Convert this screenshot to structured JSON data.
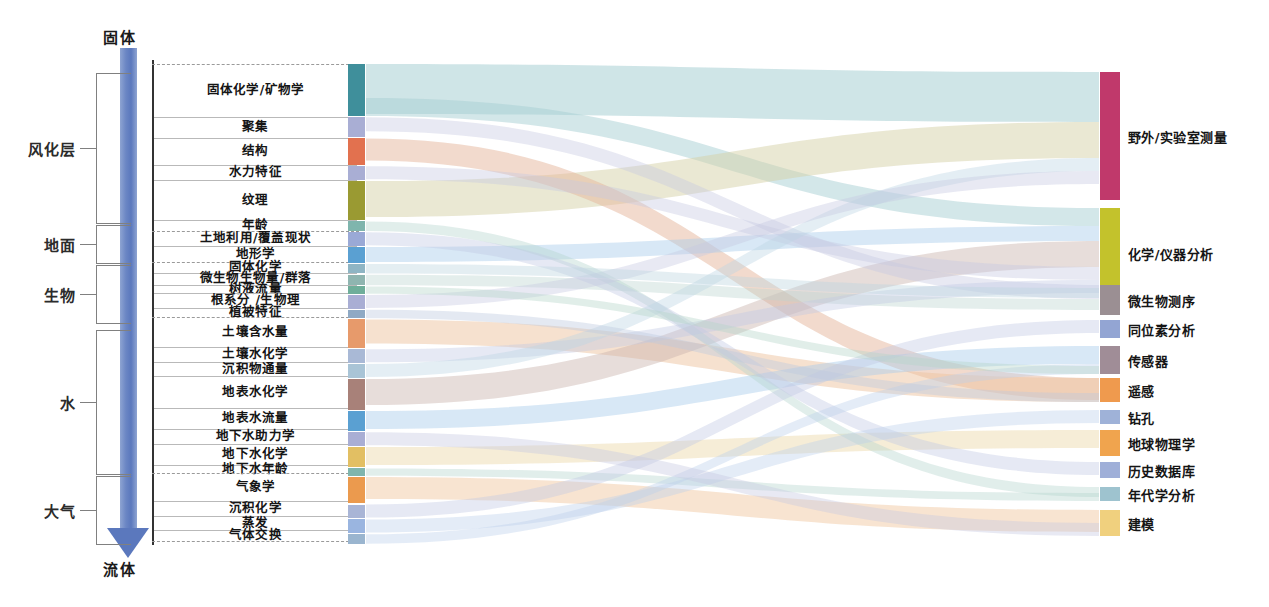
{
  "axis": {
    "top_label": "固体",
    "bottom_label": "流体",
    "arrow_name": "solid-to-fluid-gradient-arrow"
  },
  "groups": [
    {
      "label": "风化层",
      "top": 73,
      "bottom": 222
    },
    {
      "label": "地面",
      "top": 225,
      "bottom": 262
    },
    {
      "label": "生物",
      "top": 265,
      "bottom": 322
    },
    {
      "label": "水",
      "top": 330,
      "bottom": 473
    },
    {
      "label": "大气",
      "top": 476,
      "bottom": 543
    }
  ],
  "left_items": [
    {
      "label": "固体化学/矿物学",
      "top": 64,
      "height": 50,
      "color": "#3f8f9b"
    },
    {
      "label": "聚集",
      "top": 116,
      "height": 20,
      "color": "#a9aed4"
    },
    {
      "label": "结构",
      "top": 138,
      "height": 26,
      "color": "#e2714f"
    },
    {
      "label": "水力特征",
      "top": 166,
      "height": 14,
      "color": "#a9aed4"
    },
    {
      "label": "纹理",
      "top": 182,
      "height": 38,
      "color": "#9a9a32"
    },
    {
      "label": "年龄",
      "top": 212,
      "height": 10,
      "color": "#7fb5ad"
    },
    {
      "label": "土地利用/覆盖现状",
      "top": 228,
      "height": 14,
      "color": "#9aa9d6"
    },
    {
      "label": "地形学",
      "top": 244,
      "height": 16,
      "color": "#5aa0d2"
    },
    {
      "label": "固体化学",
      "top": 262,
      "height": 10,
      "color": "#8fb5c4"
    },
    {
      "label": "微生物生物量/群落",
      "top": 275,
      "height": 11,
      "color": "#8fb5b0"
    },
    {
      "label": "树液流量",
      "top": 288,
      "height": 8,
      "color": "#6fae9a"
    },
    {
      "label": "根系分  /生物理",
      "top": 298,
      "height": 14,
      "color": "#a9aed4"
    },
    {
      "label": "植被特征",
      "top": 314,
      "height": 9,
      "color": "#8fa9c4"
    },
    {
      "label": "土壤含水量",
      "top": 330,
      "height": 28,
      "color": "#e79a6b"
    },
    {
      "label": "土壤水化学",
      "top": 360,
      "height": 14,
      "color": "#a9b9d6"
    },
    {
      "label": "沉积物通量",
      "top": 376,
      "height": 14,
      "color": "#a9c4d6"
    },
    {
      "label": "地表水化学",
      "top": 382,
      "height": 30,
      "color": "#a88179"
    },
    {
      "label": "地表水流量",
      "top": 414,
      "height": 20,
      "color": "#5aa0d2"
    },
    {
      "label": "地下水助力学",
      "top": 428,
      "height": 14,
      "color": "#a9aed4"
    },
    {
      "label": "地下水化学",
      "top": 444,
      "height": 20,
      "color": "#e2bf63"
    },
    {
      "label": "地下水年龄",
      "top": 466,
      "height": 8,
      "color": "#7fb5ad"
    },
    {
      "label": "气象学",
      "top": 478,
      "height": 26,
      "color": "#eb9a4e"
    },
    {
      "label": "沉积化学",
      "top": 506,
      "height": 14,
      "color": "#a9b5d6"
    },
    {
      "label": "蒸发",
      "top": 522,
      "height": 14,
      "color": "#9ab5e0"
    },
    {
      "label": "气体交换",
      "top": 536,
      "height": 10,
      "color": "#9ab5cf"
    }
  ],
  "left_rows": [
    {
      "label": "固体化学/矿物学",
      "top": 64,
      "height": 48
    },
    {
      "label": "聚集",
      "top": 112,
      "height": 22
    },
    {
      "label": "结构",
      "top": 134,
      "height": 24
    },
    {
      "label": "水力特征",
      "top": 158,
      "height": 20
    },
    {
      "label": "纹理",
      "top": 178,
      "height": 34
    },
    {
      "label": "年龄",
      "top": 212,
      "height": 14
    },
    {
      "label": "土地利用/覆盖现状",
      "top": 226,
      "height": 19
    },
    {
      "label": "地形学",
      "top": 245,
      "height": 17
    },
    {
      "label": "固体化学",
      "top": 262,
      "height": 14
    },
    {
      "label": "微生物生物量/群落",
      "top": 276,
      "height": 16
    },
    {
      "label": "树液流量",
      "top": 292,
      "height": 14
    },
    {
      "label": "根系分  /生物理",
      "top": 306,
      "height": 15
    },
    {
      "label": "植被特征",
      "top": 321,
      "height": 14
    },
    {
      "label": "土壤含水量",
      "top": 337,
      "height": 24
    },
    {
      "label": "土壤水化学",
      "top": 361,
      "height": 18
    },
    {
      "label": "沉积物通量",
      "top": 379,
      "height": 18
    },
    {
      "label": "地表水化学",
      "top": 397,
      "height": 24
    },
    {
      "label": "地表水流量",
      "top": 421,
      "height": 21
    },
    {
      "label": "地下水助力学",
      "top": 442,
      "height": 18
    },
    {
      "label": "地下水化学",
      "top": 460,
      "height": 22
    },
    {
      "label": "地下水年龄",
      "top": 482,
      "height": 17
    },
    {
      "label": "气象学",
      "top": 501,
      "height": 22
    },
    {
      "label": "沉积化学",
      "top": 523,
      "height": 18
    },
    {
      "label": "蒸发",
      "top": 541,
      "height": 17
    },
    {
      "label": "气体交换",
      "top": 558,
      "height": 18
    }
  ],
  "right_items": [
    {
      "label": "野外/实验室测量",
      "top": 72,
      "height": 128,
      "color": "#c0396b"
    },
    {
      "label": "化学/仪器分析",
      "top": 208,
      "height": 90,
      "color": "#c3c22c"
    },
    {
      "label": "微生物测序",
      "top": 285,
      "height": 30,
      "color": "#9b8f93"
    },
    {
      "label": "同位素分析",
      "top": 320,
      "height": 18,
      "color": "#93a5d3"
    },
    {
      "label": "传感器",
      "top": 346,
      "height": 28,
      "color": "#a08d97"
    },
    {
      "label": "遥感",
      "top": 378,
      "height": 24,
      "color": "#ef9a4e"
    },
    {
      "label": "钻孔",
      "top": 410,
      "height": 14,
      "color": "#9fb2d8"
    },
    {
      "label": "地球物理学",
      "top": 430,
      "height": 26,
      "color": "#f0a44e"
    },
    {
      "label": "历史数据库",
      "top": 462,
      "height": 16,
      "color": "#9fafd8"
    },
    {
      "label": "年代学分析",
      "top": 487,
      "height": 14,
      "color": "#9ec3cf"
    },
    {
      "label": "建模",
      "top": 510,
      "height": 26,
      "color": "#f0d07e"
    }
  ],
  "flows": [
    {
      "from": "固体化学/矿物学",
      "to": "野外/实验室测量",
      "color": "#a8cfd4",
      "width": 50,
      "y0": 64,
      "y1": 76,
      "opacity": 0.55
    },
    {
      "from": "固体化学/矿物学",
      "to": "化学/仪器分析",
      "color": "#a8cfd4",
      "width": 18,
      "y0": 106,
      "y1": 212,
      "opacity": 0.5
    },
    {
      "from": "纹理",
      "to": "野外/实验室测量",
      "color": "#d6d2a8",
      "width": 36,
      "y0": 184,
      "y1": 130,
      "opacity": 0.5
    },
    {
      "from": "结构",
      "to": "遥感",
      "color": "#e6b59b",
      "width": 22,
      "y0": 140,
      "y1": 382,
      "opacity": 0.5
    },
    {
      "from": "土壤含水量",
      "to": "遥感",
      "color": "#eec4a0",
      "width": 24,
      "y0": 332,
      "y1": 388,
      "opacity": 0.5
    },
    {
      "from": "地形学",
      "to": "化学/仪器分析",
      "color": "#a8ccea",
      "width": 15,
      "y0": 246,
      "y1": 252,
      "opacity": 0.45
    },
    {
      "from": "地表水化学",
      "to": "化学/仪器分析",
      "color": "#c9b4ae",
      "width": 26,
      "y0": 384,
      "y1": 240,
      "opacity": 0.45
    },
    {
      "from": "地表水流量",
      "to": "传感器",
      "color": "#a8ccea",
      "width": 18,
      "y0": 416,
      "y1": 350,
      "opacity": 0.45
    },
    {
      "from": "地下水化学",
      "to": "地球物理学",
      "color": "#ecd8a6",
      "width": 18,
      "y0": 446,
      "y1": 434,
      "opacity": 0.45
    },
    {
      "from": "气象学",
      "to": "建模",
      "color": "#f0c49a",
      "width": 22,
      "y0": 480,
      "y1": 512,
      "opacity": 0.45
    },
    {
      "from": "聚集",
      "to": "微生物测序",
      "color": "#c5c8e2",
      "width": 14,
      "y0": 118,
      "y1": 290,
      "opacity": 0.4
    },
    {
      "from": "微生物生物量/群落",
      "to": "微生物测序",
      "color": "#bcd4d0",
      "width": 11,
      "y0": 276,
      "y1": 300,
      "opacity": 0.4
    },
    {
      "from": "年龄",
      "to": "年代学分析",
      "color": "#b4d4ce",
      "width": 10,
      "y0": 213,
      "y1": 489,
      "opacity": 0.4
    },
    {
      "from": "地下水年龄",
      "to": "年代学分析",
      "color": "#b4d4ce",
      "width": 8,
      "y0": 467,
      "y1": 495,
      "opacity": 0.4
    },
    {
      "from": "土地利用/覆盖现状",
      "to": "历史数据库",
      "color": "#c0c9e4",
      "width": 13,
      "y0": 229,
      "y1": 464,
      "opacity": 0.4
    },
    {
      "from": "沉积化学",
      "to": "同位素分析",
      "color": "#c0c9e4",
      "width": 13,
      "y0": 507,
      "y1": 322,
      "opacity": 0.4
    },
    {
      "from": "蒸发",
      "to": "钻孔",
      "color": "#bcd0ea",
      "width": 13,
      "y0": 523,
      "y1": 412,
      "opacity": 0.4
    },
    {
      "from": "气体交换",
      "to": "传感器",
      "color": "#bcd0ea",
      "width": 10,
      "y0": 537,
      "y1": 362,
      "opacity": 0.4
    },
    {
      "from": "水力特征",
      "to": "化学/仪器分析",
      "color": "#c5c8e2",
      "width": 13,
      "y0": 167,
      "y1": 276,
      "opacity": 0.4
    },
    {
      "from": "土壤水化学",
      "to": "化学/仪器分析",
      "color": "#c0c9e4",
      "width": 13,
      "y0": 361,
      "y1": 290,
      "opacity": 0.4
    },
    {
      "from": "沉积物通量",
      "to": "野外/实验室测量",
      "color": "#bcd4e4",
      "width": 13,
      "y0": 377,
      "y1": 160,
      "opacity": 0.4
    },
    {
      "from": "地下水助力学",
      "to": "建模",
      "color": "#c5c8e2",
      "width": 13,
      "y0": 429,
      "y1": 524,
      "opacity": 0.4
    },
    {
      "from": "根系分  /生物理",
      "to": "野外/实验室测量",
      "color": "#c5c8e2",
      "width": 13,
      "y0": 299,
      "y1": 178,
      "opacity": 0.4
    },
    {
      "from": "植被特征",
      "to": "遥感",
      "color": "#bcc9de",
      "width": 9,
      "y0": 315,
      "y1": 398,
      "opacity": 0.4
    },
    {
      "from": "树液流量",
      "to": "传感器",
      "color": "#b4d4c8",
      "width": 8,
      "y0": 289,
      "y1": 370,
      "opacity": 0.4
    },
    {
      "from": "固体化学",
      "to": "化学/仪器分析",
      "color": "#bcd4de",
      "width": 10,
      "y0": 263,
      "y1": 264,
      "opacity": 0.4
    }
  ]
}
